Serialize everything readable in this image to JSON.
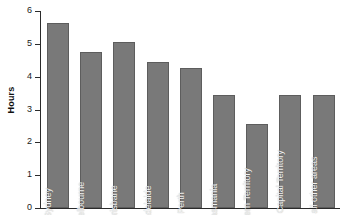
{
  "chart_data": {
    "type": "bar",
    "title": "",
    "xlabel": "",
    "ylabel": "Hours",
    "ylim": [
      0,
      6
    ],
    "yticks": [
      "0",
      "1",
      "2",
      "3",
      "4",
      "5",
      "6"
    ],
    "grid": false,
    "legend": "none",
    "bar_color": "#797979",
    "bar_edge_color": "#5d5d5d",
    "axis_color": "#2b2b2b",
    "label_color": "#f2f2f2",
    "categories": [
      "Sydney",
      "Melbourne",
      "Brisbane",
      "Adelaide",
      "Perth",
      "Tasmania",
      "Northern Territory",
      "Australian Capital Territory",
      "Average all other areas"
    ],
    "values": [
      5.65,
      4.75,
      5.05,
      4.45,
      4.25,
      3.45,
      2.55,
      3.45,
      3.45
    ]
  }
}
